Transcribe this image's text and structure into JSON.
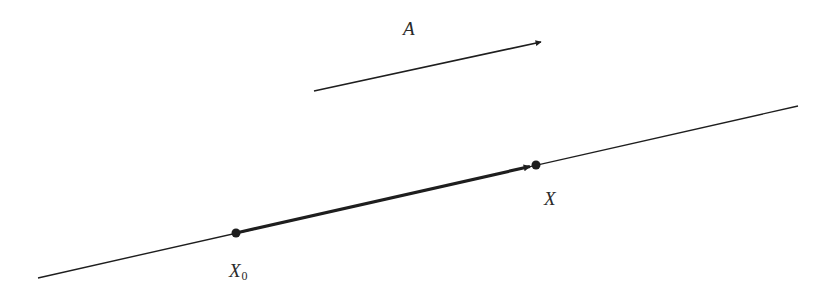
{
  "diagram": {
    "colors": {
      "background": "#ffffff",
      "ink": "#1e1e1e",
      "label": "#2a2a2a"
    },
    "vector_a": {
      "label": "A",
      "start": [
        314,
        91
      ],
      "end": [
        541,
        42
      ]
    },
    "line": {
      "start": [
        38,
        278
      ],
      "end": [
        798,
        106
      ]
    },
    "points": [
      {
        "id": "x0",
        "label": "X",
        "subscript": "0",
        "position": [
          236,
          233
        ]
      },
      {
        "id": "x",
        "label": "X",
        "subscript": "",
        "position": [
          536,
          165
        ]
      }
    ],
    "segment": {
      "from": "x0",
      "to": "x",
      "arrow_tip": [
        530,
        166.5
      ]
    }
  }
}
